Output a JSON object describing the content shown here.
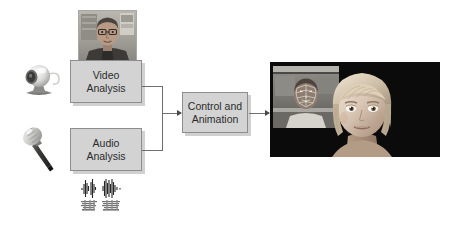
{
  "diagram": {
    "title": "Audio-visual driven facial animation pipeline",
    "background_color": "#ffffff",
    "box_fill_color": "#d3d3d3",
    "box_border_color": "#8d8d8d",
    "line_color": "#6e6e6e",
    "text_color": "#2b2b2b"
  },
  "nodes": {
    "video_analysis": {
      "label_line1": "Video",
      "label_line2": "Analysis"
    },
    "audio_analysis": {
      "label_line1": "Audio",
      "label_line2": "Analysis"
    },
    "control_animation": {
      "label_line1": "Control and",
      "label_line2": "Animation"
    }
  },
  "icons": {
    "webcam": "webcam-icon",
    "microphone": "microphone-icon",
    "person_photo": "person-photo-thumbnail",
    "waveform": "audio-waveform-spectrogram"
  },
  "output_panel": {
    "name": "avatar-render-output",
    "inset": "tracked-face-video-inset",
    "avatar": "animated-avatar-head",
    "background_color": "#0b0b0b"
  },
  "connections": [
    {
      "name": "video-to-control",
      "from": "video_analysis",
      "to": "control_animation"
    },
    {
      "name": "audio-to-control",
      "from": "audio_analysis",
      "to": "control_animation"
    },
    {
      "name": "control-to-output",
      "from": "control_animation",
      "to": "output_panel"
    }
  ]
}
